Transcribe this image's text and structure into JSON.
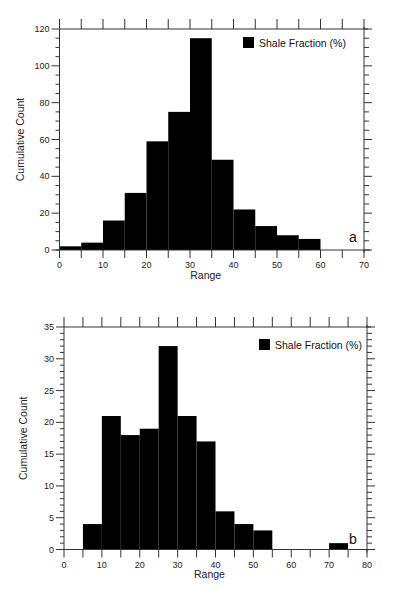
{
  "chart_data": [
    {
      "panel": "a",
      "type": "bar",
      "title": "",
      "xlabel": "Range",
      "ylabel": "Cumulative Count",
      "legend": [
        "Shale Fraction (%)"
      ],
      "legend_position": "top-right",
      "xlim": [
        0,
        70
      ],
      "ylim": [
        0,
        120
      ],
      "xticks": [
        0,
        10,
        20,
        30,
        40,
        50,
        60,
        70
      ],
      "yticks": [
        0,
        20,
        40,
        60,
        80,
        100,
        120
      ],
      "bin_width": 5,
      "categories": [
        "0-5",
        "5-10",
        "10-15",
        "15-20",
        "20-25",
        "25-30",
        "30-35",
        "35-40",
        "40-45",
        "45-50",
        "50-55",
        "55-60"
      ],
      "bins": [
        [
          0,
          5
        ],
        [
          5,
          10
        ],
        [
          10,
          15
        ],
        [
          15,
          20
        ],
        [
          20,
          25
        ],
        [
          25,
          30
        ],
        [
          30,
          35
        ],
        [
          35,
          40
        ],
        [
          40,
          45
        ],
        [
          45,
          50
        ],
        [
          50,
          55
        ],
        [
          55,
          60
        ]
      ],
      "series": [
        {
          "name": "Shale Fraction (%)",
          "values": [
            2,
            4,
            16,
            31,
            59,
            75,
            115,
            49,
            22,
            13,
            8,
            6
          ],
          "color": "#000000"
        }
      ],
      "grid": false
    },
    {
      "panel": "b",
      "type": "bar",
      "title": "",
      "xlabel": "Range",
      "ylabel": "Cumulative Count",
      "legend": [
        "Shale Fraction (%)"
      ],
      "legend_position": "top-right",
      "xlim": [
        0,
        80
      ],
      "ylim": [
        0,
        35
      ],
      "xticks": [
        0,
        10,
        20,
        30,
        40,
        50,
        60,
        70,
        80
      ],
      "yticks": [
        0,
        5,
        10,
        15,
        20,
        25,
        30,
        35
      ],
      "bin_width": 5,
      "categories": [
        "5-10",
        "10-15",
        "15-20",
        "20-25",
        "25-30",
        "30-35",
        "35-40",
        "40-45",
        "45-50",
        "50-55",
        "70-75"
      ],
      "bins": [
        [
          5,
          10
        ],
        [
          10,
          15
        ],
        [
          15,
          20
        ],
        [
          20,
          25
        ],
        [
          25,
          30
        ],
        [
          30,
          35
        ],
        [
          35,
          40
        ],
        [
          40,
          45
        ],
        [
          45,
          50
        ],
        [
          50,
          55
        ],
        [
          70,
          75
        ]
      ],
      "series": [
        {
          "name": "Shale Fraction (%)",
          "values": [
            4,
            21,
            18,
            19,
            32,
            21,
            17,
            6,
            4,
            3,
            1
          ],
          "color": "#000000"
        }
      ],
      "grid": false
    }
  ],
  "panels": {
    "a": {
      "label": "a",
      "xlabel": "Range",
      "ylabel": "Cumulative Count",
      "legend": "Shale Fraction (%)"
    },
    "b": {
      "label": "b",
      "xlabel": "Range",
      "ylabel": "Cumulative Count",
      "legend": "Shale Fraction (%)"
    }
  },
  "colors": {
    "bar": "#000000",
    "axis": "#333333",
    "text": "#222222"
  }
}
